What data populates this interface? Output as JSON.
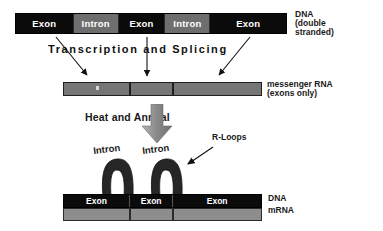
{
  "diagram": {
    "colors": {
      "exon_fill": "#0b0b0b",
      "intron_fill": "#6e6e6e",
      "mrna_fill": "#767676",
      "hybrid_mrna_fill": "#8d8d8d",
      "loop_fill": "#262626",
      "text": "#1a1a1a",
      "heat_arrow": "#8a8a8a"
    }
  },
  "dna_top": {
    "segments": [
      {
        "label": "Exon",
        "type": "exon",
        "width_pct": 21
      },
      {
        "label": "Intron",
        "type": "intron",
        "width_pct": 17
      },
      {
        "label": "Exon",
        "type": "exon",
        "width_pct": 17
      },
      {
        "label": "Intron",
        "type": "intron",
        "width_pct": 17
      },
      {
        "label": "Exon",
        "type": "exon",
        "width_pct": 28
      }
    ],
    "label_line_1": "DNA",
    "label_line_2": "(double",
    "label_line_3": "stranded)"
  },
  "transcription": {
    "caption": "Transcription and Splicing",
    "arrow_count": 3
  },
  "mrna": {
    "segments": [
      {
        "label": "",
        "width_pct": 33
      },
      {
        "label": "",
        "width_pct": 22
      },
      {
        "label": "",
        "width_pct": 45
      }
    ],
    "label_line_1": "messenger RNA",
    "label_line_2": "(exons only)"
  },
  "heat": {
    "caption": "Heat and Anneal"
  },
  "rloops": {
    "label": "R-Loops"
  },
  "loops": [
    {
      "label": "Intron"
    },
    {
      "label": "Intron"
    }
  ],
  "hybrid": {
    "dna_segments": [
      {
        "label": "Exon",
        "width_pct": 33
      },
      {
        "label": "Exon",
        "width_pct": 22
      },
      {
        "label": "Exon",
        "width_pct": 45
      }
    ],
    "mrna_segments": [
      {
        "width_pct": 33
      },
      {
        "width_pct": 22
      },
      {
        "width_pct": 45
      }
    ],
    "label_dna": "DNA",
    "label_mrna": "mRNA"
  }
}
